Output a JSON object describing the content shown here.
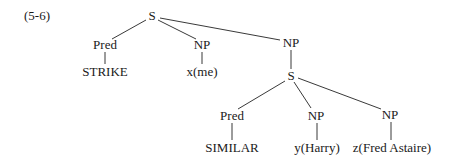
{
  "example_number": "(5-6)",
  "tree": {
    "root": "S",
    "nodes": [
      {
        "id": "S1",
        "label": "S",
        "x": 152,
        "y": 16
      },
      {
        "id": "Pred1",
        "label": "Pred",
        "x": 105,
        "y": 45
      },
      {
        "id": "NP1",
        "label": "NP",
        "x": 202,
        "y": 45
      },
      {
        "id": "NP2",
        "label": "NP",
        "x": 291,
        "y": 43
      },
      {
        "id": "STRIKE",
        "label": "STRIKE",
        "x": 105,
        "y": 72
      },
      {
        "id": "xme",
        "label": "x(me)",
        "x": 202,
        "y": 72
      },
      {
        "id": "S2",
        "label": "S",
        "x": 291,
        "y": 76
      },
      {
        "id": "Pred2",
        "label": "Pred",
        "x": 232,
        "y": 116
      },
      {
        "id": "NP3",
        "label": "NP",
        "x": 316,
        "y": 116
      },
      {
        "id": "NP4",
        "label": "NP",
        "x": 390,
        "y": 115
      },
      {
        "id": "SIMILAR",
        "label": "SIMILAR",
        "x": 232,
        "y": 148
      },
      {
        "id": "yharry",
        "label": "y(Harry)",
        "x": 317,
        "y": 148
      },
      {
        "id": "zfred",
        "label": "z(Fred Astaire)",
        "x": 392,
        "y": 148
      }
    ],
    "edges": [
      [
        "S1",
        "Pred1"
      ],
      [
        "S1",
        "NP1"
      ],
      [
        "S1",
        "NP2"
      ],
      [
        "Pred1",
        "STRIKE"
      ],
      [
        "NP1",
        "xme"
      ],
      [
        "NP2",
        "S2"
      ],
      [
        "S2",
        "Pred2"
      ],
      [
        "S2",
        "NP3"
      ],
      [
        "S2",
        "NP4"
      ],
      [
        "Pred2",
        "SIMILAR"
      ],
      [
        "NP3",
        "yharry"
      ],
      [
        "NP4",
        "zfred"
      ]
    ]
  }
}
